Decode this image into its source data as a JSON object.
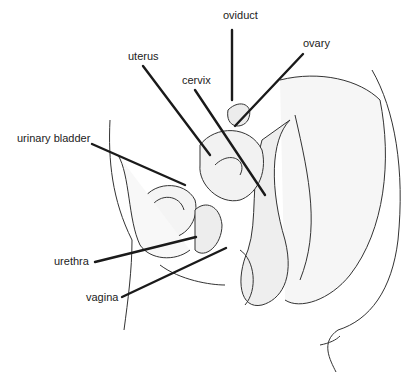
{
  "diagram": {
    "colors": {
      "line": "#1a1a1a",
      "ink": "#333333",
      "background": "#ffffff"
    },
    "labels": [
      {
        "id": "oviduct",
        "text": "oviduct",
        "x": 223,
        "y": 16,
        "line": [
          232,
          30,
          232,
          100
        ]
      },
      {
        "id": "ovary",
        "text": "ovary",
        "x": 303,
        "y": 40,
        "line": [
          303,
          54,
          235,
          126
        ]
      },
      {
        "id": "uterus",
        "text": "uterus",
        "x": 128,
        "y": 50,
        "line": [
          143,
          66,
          210,
          155
        ]
      },
      {
        "id": "cervix",
        "text": "cervix",
        "x": 182,
        "y": 73,
        "line": [
          195,
          90,
          265,
          195
        ]
      },
      {
        "id": "urinary-bladder",
        "text": "urinary bladder",
        "x": 17,
        "y": 133,
        "line": [
          92,
          144,
          185,
          185
        ]
      },
      {
        "id": "urethra",
        "text": "urethra",
        "x": 54,
        "y": 256,
        "line": [
          95,
          262,
          196,
          237
        ]
      },
      {
        "id": "vagina",
        "text": "vagina",
        "x": 86,
        "y": 291,
        "line": [
          122,
          297,
          226,
          248
        ]
      }
    ]
  }
}
